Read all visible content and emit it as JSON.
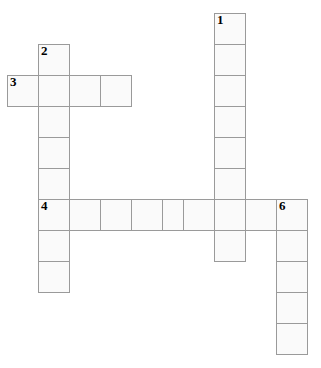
{
  "puzzle": {
    "type": "crossword-grid",
    "title": "Crossword puzzle grid",
    "geometry": {
      "cell_size": 31,
      "origin_x": 7,
      "origin_y": 13,
      "canvas_width": 321,
      "canvas_height": 368
    },
    "colors": {
      "cell_fill": "#fafafa",
      "cell_border": "#9a9a9a",
      "number_color": "#000000",
      "background": "#ffffff"
    },
    "entries": [
      {
        "number": "1",
        "direction": "down",
        "length": 8,
        "start_col": 6.7,
        "start_row": 0
      },
      {
        "number": "2",
        "direction": "down",
        "length": 8,
        "start_col": 1,
        "start_row": 1
      },
      {
        "number": "3",
        "direction": "across",
        "length": 4,
        "start_col": 0,
        "start_row": 2
      },
      {
        "number": "4",
        "direction": "across",
        "length": 9,
        "start_col": 1,
        "start_row": 6
      },
      {
        "number": "6",
        "direction": "down",
        "length": 5,
        "start_col": 8.7,
        "start_row": 6
      }
    ],
    "cells": [
      {
        "x": 214,
        "y": 13,
        "number": "1"
      },
      {
        "x": 214,
        "y": 44,
        "number": ""
      },
      {
        "x": 214,
        "y": 75,
        "number": ""
      },
      {
        "x": 214,
        "y": 106,
        "number": ""
      },
      {
        "x": 214,
        "y": 137,
        "number": ""
      },
      {
        "x": 214,
        "y": 168,
        "number": ""
      },
      {
        "x": 214,
        "y": 199,
        "number": ""
      },
      {
        "x": 214,
        "y": 230,
        "number": ""
      },
      {
        "x": 38,
        "y": 44,
        "number": "2"
      },
      {
        "x": 38,
        "y": 75,
        "number": ""
      },
      {
        "x": 38,
        "y": 106,
        "number": ""
      },
      {
        "x": 38,
        "y": 137,
        "number": ""
      },
      {
        "x": 38,
        "y": 168,
        "number": ""
      },
      {
        "x": 38,
        "y": 199,
        "number": "4"
      },
      {
        "x": 38,
        "y": 230,
        "number": ""
      },
      {
        "x": 38,
        "y": 261,
        "number": ""
      },
      {
        "x": 7,
        "y": 75,
        "number": "3"
      },
      {
        "x": 69,
        "y": 75,
        "number": ""
      },
      {
        "x": 100,
        "y": 75,
        "number": ""
      },
      {
        "x": 69,
        "y": 199,
        "number": ""
      },
      {
        "x": 100,
        "y": 199,
        "number": ""
      },
      {
        "x": 131,
        "y": 199,
        "number": ""
      },
      {
        "x": 162,
        "y": 199,
        "number": ""
      },
      {
        "x": 183,
        "y": 199,
        "number": ""
      },
      {
        "x": 245,
        "y": 199,
        "number": ""
      },
      {
        "x": 276,
        "y": 199,
        "number": "6"
      },
      {
        "x": 276,
        "y": 230,
        "number": ""
      },
      {
        "x": 276,
        "y": 261,
        "number": ""
      },
      {
        "x": 276,
        "y": 292,
        "number": ""
      },
      {
        "x": 276,
        "y": 323,
        "number": ""
      }
    ]
  }
}
